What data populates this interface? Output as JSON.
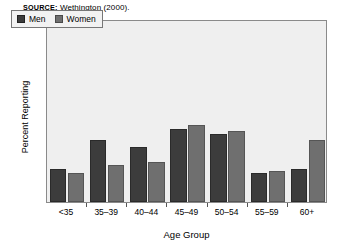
{
  "source": {
    "prefix": "SOURCE:",
    "text": "Wethington (2000)."
  },
  "chart_data": {
    "type": "bar",
    "title": "",
    "xlabel": "Age Group",
    "ylabel": "Percent Reporting",
    "categories": [
      "<35",
      "35–39",
      "40–44",
      "45–49",
      "50–54",
      "55–59",
      "60+"
    ],
    "series": [
      {
        "name": "Men",
        "color": "#3c3c3c",
        "values": [
          9,
          17,
          15,
          20,
          18.5,
          8,
          9
        ]
      },
      {
        "name": "Women",
        "color": "#6f6f6f",
        "values": [
          8,
          10,
          11,
          21,
          19.5,
          8.5,
          17
        ]
      }
    ],
    "ylim": [
      0,
      50
    ],
    "ystep": 5,
    "yticks": [
      "50",
      "45",
      "40",
      "35",
      "30",
      "25",
      "20",
      "15",
      "10",
      "5",
      "0"
    ],
    "grid": false,
    "legend_position": "top-left",
    "plot_background": "#efefef"
  }
}
